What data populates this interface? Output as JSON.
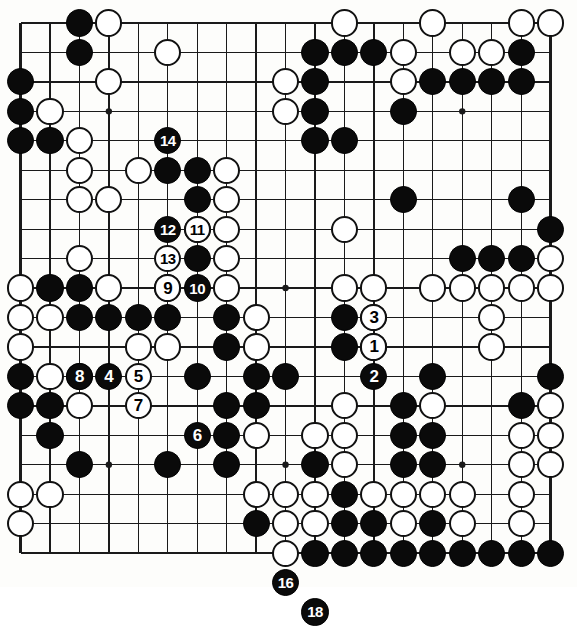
{
  "diagram": {
    "type": "go-board-diagram",
    "board_size": 19,
    "colors": {
      "black_stone": "#0a0a0a",
      "white_stone": "#ffffff",
      "stone_outline": "#111111",
      "grid_line": "#1a1a1a",
      "board_background": "#fdfdfb"
    },
    "geometry": {
      "origin_x": 20.5,
      "origin_y": 23.0,
      "spacing": 29.45,
      "stone_radius": 13.6,
      "border_width": 2.6,
      "line_width": 1.3,
      "star_radius": 3.2
    },
    "star_points": [
      [
        3,
        3
      ],
      [
        9,
        3
      ],
      [
        15,
        3
      ],
      [
        3,
        9
      ],
      [
        9,
        9
      ],
      [
        15,
        9
      ],
      [
        3,
        15
      ],
      [
        9,
        15
      ],
      [
        15,
        15
      ]
    ],
    "stones": [
      {
        "c": 2,
        "r": 0,
        "color": "black"
      },
      {
        "c": 3,
        "r": 0,
        "color": "white"
      },
      {
        "c": 11,
        "r": 0,
        "color": "white"
      },
      {
        "c": 14,
        "r": 0,
        "color": "white"
      },
      {
        "c": 17,
        "r": 0,
        "color": "white"
      },
      {
        "c": 18,
        "r": 0,
        "color": "white"
      },
      {
        "c": 2,
        "r": 1,
        "color": "black"
      },
      {
        "c": 5,
        "r": 1,
        "color": "white"
      },
      {
        "c": 10,
        "r": 1,
        "color": "black"
      },
      {
        "c": 11,
        "r": 1,
        "color": "black"
      },
      {
        "c": 12,
        "r": 1,
        "color": "black"
      },
      {
        "c": 13,
        "r": 1,
        "color": "white"
      },
      {
        "c": 15,
        "r": 1,
        "color": "white"
      },
      {
        "c": 16,
        "r": 1,
        "color": "white"
      },
      {
        "c": 17,
        "r": 1,
        "color": "black"
      },
      {
        "c": 0,
        "r": 2,
        "color": "black"
      },
      {
        "c": 3,
        "r": 2,
        "color": "white"
      },
      {
        "c": 9,
        "r": 2,
        "color": "white"
      },
      {
        "c": 10,
        "r": 2,
        "color": "black"
      },
      {
        "c": 13,
        "r": 2,
        "color": "white"
      },
      {
        "c": 14,
        "r": 2,
        "color": "black"
      },
      {
        "c": 15,
        "r": 2,
        "color": "black"
      },
      {
        "c": 16,
        "r": 2,
        "color": "black"
      },
      {
        "c": 17,
        "r": 2,
        "color": "black"
      },
      {
        "c": 0,
        "r": 3,
        "color": "black"
      },
      {
        "c": 1,
        "r": 3,
        "color": "white"
      },
      {
        "c": 9,
        "r": 3,
        "color": "white"
      },
      {
        "c": 10,
        "r": 3,
        "color": "black"
      },
      {
        "c": 13,
        "r": 3,
        "color": "black"
      },
      {
        "c": 0,
        "r": 4,
        "color": "black"
      },
      {
        "c": 1,
        "r": 4,
        "color": "black"
      },
      {
        "c": 2,
        "r": 4,
        "color": "white"
      },
      {
        "c": 10,
        "r": 4,
        "color": "black"
      },
      {
        "c": 11,
        "r": 4,
        "color": "black"
      },
      {
        "c": 2,
        "r": 5,
        "color": "white"
      },
      {
        "c": 4,
        "r": 5,
        "color": "white"
      },
      {
        "c": 5,
        "r": 5,
        "color": "black"
      },
      {
        "c": 6,
        "r": 5,
        "color": "black"
      },
      {
        "c": 7,
        "r": 5,
        "color": "white"
      },
      {
        "c": 2,
        "r": 6,
        "color": "white"
      },
      {
        "c": 3,
        "r": 6,
        "color": "white"
      },
      {
        "c": 6,
        "r": 6,
        "color": "black"
      },
      {
        "c": 7,
        "r": 6,
        "color": "white"
      },
      {
        "c": 13,
        "r": 6,
        "color": "black"
      },
      {
        "c": 17,
        "r": 6,
        "color": "black"
      },
      {
        "c": 6,
        "r": 7,
        "color": "black"
      },
      {
        "c": 7,
        "r": 7,
        "color": "white"
      },
      {
        "c": 11,
        "r": 7,
        "color": "white"
      },
      {
        "c": 18,
        "r": 7,
        "color": "black"
      },
      {
        "c": 2,
        "r": 8,
        "color": "white"
      },
      {
        "c": 6,
        "r": 8,
        "color": "black"
      },
      {
        "c": 7,
        "r": 8,
        "color": "white"
      },
      {
        "c": 15,
        "r": 8,
        "color": "black"
      },
      {
        "c": 16,
        "r": 8,
        "color": "black"
      },
      {
        "c": 17,
        "r": 8,
        "color": "black"
      },
      {
        "c": 18,
        "r": 8,
        "color": "white"
      },
      {
        "c": 0,
        "r": 9,
        "color": "white"
      },
      {
        "c": 1,
        "r": 9,
        "color": "black"
      },
      {
        "c": 2,
        "r": 9,
        "color": "black"
      },
      {
        "c": 3,
        "r": 9,
        "color": "white"
      },
      {
        "c": 5,
        "r": 9,
        "color": "black"
      },
      {
        "c": 7,
        "r": 9,
        "color": "white"
      },
      {
        "c": 11,
        "r": 9,
        "color": "white"
      },
      {
        "c": 12,
        "r": 9,
        "color": "white"
      },
      {
        "c": 14,
        "r": 9,
        "color": "white"
      },
      {
        "c": 15,
        "r": 9,
        "color": "white"
      },
      {
        "c": 16,
        "r": 9,
        "color": "white"
      },
      {
        "c": 17,
        "r": 9,
        "color": "white"
      },
      {
        "c": 18,
        "r": 9,
        "color": "white"
      },
      {
        "c": 0,
        "r": 10,
        "color": "white"
      },
      {
        "c": 1,
        "r": 10,
        "color": "white"
      },
      {
        "c": 2,
        "r": 10,
        "color": "black"
      },
      {
        "c": 3,
        "r": 10,
        "color": "black"
      },
      {
        "c": 4,
        "r": 10,
        "color": "black"
      },
      {
        "c": 5,
        "r": 10,
        "color": "black"
      },
      {
        "c": 7,
        "r": 10,
        "color": "black"
      },
      {
        "c": 8,
        "r": 10,
        "color": "white"
      },
      {
        "c": 11,
        "r": 10,
        "color": "black"
      },
      {
        "c": 12,
        "r": 10,
        "color": "black"
      },
      {
        "c": 16,
        "r": 10,
        "color": "white"
      },
      {
        "c": 0,
        "r": 11,
        "color": "white"
      },
      {
        "c": 4,
        "r": 11,
        "color": "white"
      },
      {
        "c": 5,
        "r": 11,
        "color": "white"
      },
      {
        "c": 7,
        "r": 11,
        "color": "black"
      },
      {
        "c": 8,
        "r": 11,
        "color": "white"
      },
      {
        "c": 11,
        "r": 11,
        "color": "black"
      },
      {
        "c": 12,
        "r": 11,
        "color": "black"
      },
      {
        "c": 16,
        "r": 11,
        "color": "white"
      },
      {
        "c": 0,
        "r": 12,
        "color": "black"
      },
      {
        "c": 1,
        "r": 12,
        "color": "white"
      },
      {
        "c": 2,
        "r": 12,
        "color": "white"
      },
      {
        "c": 6,
        "r": 12,
        "color": "black"
      },
      {
        "c": 8,
        "r": 12,
        "color": "black"
      },
      {
        "c": 9,
        "r": 12,
        "color": "black"
      },
      {
        "c": 14,
        "r": 12,
        "color": "black"
      },
      {
        "c": 18,
        "r": 12,
        "color": "black"
      },
      {
        "c": 0,
        "r": 13,
        "color": "black"
      },
      {
        "c": 1,
        "r": 13,
        "color": "black"
      },
      {
        "c": 2,
        "r": 13,
        "color": "white"
      },
      {
        "c": 7,
        "r": 13,
        "color": "black"
      },
      {
        "c": 8,
        "r": 13,
        "color": "black"
      },
      {
        "c": 11,
        "r": 13,
        "color": "white"
      },
      {
        "c": 13,
        "r": 13,
        "color": "black"
      },
      {
        "c": 14,
        "r": 13,
        "color": "white"
      },
      {
        "c": 17,
        "r": 13,
        "color": "black"
      },
      {
        "c": 18,
        "r": 13,
        "color": "white"
      },
      {
        "c": 1,
        "r": 14,
        "color": "black"
      },
      {
        "c": 7,
        "r": 14,
        "color": "black"
      },
      {
        "c": 8,
        "r": 14,
        "color": "white"
      },
      {
        "c": 10,
        "r": 14,
        "color": "white"
      },
      {
        "c": 11,
        "r": 14,
        "color": "white"
      },
      {
        "c": 13,
        "r": 14,
        "color": "black"
      },
      {
        "c": 14,
        "r": 14,
        "color": "black"
      },
      {
        "c": 17,
        "r": 14,
        "color": "white"
      },
      {
        "c": 18,
        "r": 14,
        "color": "white"
      },
      {
        "c": 2,
        "r": 15,
        "color": "black"
      },
      {
        "c": 5,
        "r": 15,
        "color": "black"
      },
      {
        "c": 7,
        "r": 15,
        "color": "black"
      },
      {
        "c": 10,
        "r": 15,
        "color": "black"
      },
      {
        "c": 11,
        "r": 15,
        "color": "white"
      },
      {
        "c": 13,
        "r": 15,
        "color": "black"
      },
      {
        "c": 14,
        "r": 15,
        "color": "black"
      },
      {
        "c": 17,
        "r": 15,
        "color": "white"
      },
      {
        "c": 18,
        "r": 15,
        "color": "white"
      },
      {
        "c": 0,
        "r": 16,
        "color": "white"
      },
      {
        "c": 1,
        "r": 16,
        "color": "white"
      },
      {
        "c": 8,
        "r": 16,
        "color": "white"
      },
      {
        "c": 9,
        "r": 16,
        "color": "white"
      },
      {
        "c": 10,
        "r": 16,
        "color": "white"
      },
      {
        "c": 11,
        "r": 16,
        "color": "black"
      },
      {
        "c": 12,
        "r": 16,
        "color": "white"
      },
      {
        "c": 13,
        "r": 16,
        "color": "white"
      },
      {
        "c": 14,
        "r": 16,
        "color": "white"
      },
      {
        "c": 15,
        "r": 16,
        "color": "white"
      },
      {
        "c": 17,
        "r": 16,
        "color": "white"
      },
      {
        "c": 0,
        "r": 17,
        "color": "white"
      },
      {
        "c": 8,
        "r": 17,
        "color": "black"
      },
      {
        "c": 9,
        "r": 17,
        "color": "white"
      },
      {
        "c": 10,
        "r": 17,
        "color": "white"
      },
      {
        "c": 11,
        "r": 17,
        "color": "black"
      },
      {
        "c": 12,
        "r": 17,
        "color": "black"
      },
      {
        "c": 13,
        "r": 17,
        "color": "white"
      },
      {
        "c": 14,
        "r": 17,
        "color": "black"
      },
      {
        "c": 15,
        "r": 17,
        "color": "white"
      },
      {
        "c": 17,
        "r": 17,
        "color": "white"
      },
      {
        "c": 9,
        "r": 18,
        "color": "white"
      },
      {
        "c": 10,
        "r": 18,
        "color": "black"
      },
      {
        "c": 11,
        "r": 18,
        "color": "black"
      },
      {
        "c": 12,
        "r": 18,
        "color": "black"
      },
      {
        "c": 13,
        "r": 18,
        "color": "black"
      },
      {
        "c": 14,
        "r": 18,
        "color": "black"
      },
      {
        "c": 15,
        "r": 18,
        "color": "black"
      },
      {
        "c": 16,
        "r": 18,
        "color": "black"
      },
      {
        "c": 17,
        "r": 18,
        "color": "black"
      },
      {
        "c": 18,
        "r": 18,
        "color": "black"
      }
    ],
    "moves": [
      {
        "n": "1",
        "c": 12,
        "r": 11,
        "color": "white"
      },
      {
        "n": "2",
        "c": 12,
        "r": 12,
        "color": "black"
      },
      {
        "n": "3",
        "c": 12,
        "r": 10,
        "color": "white"
      },
      {
        "n": "4",
        "c": 3,
        "r": 12,
        "color": "black"
      },
      {
        "n": "5",
        "c": 4,
        "r": 12,
        "color": "white"
      },
      {
        "n": "6",
        "c": 6,
        "r": 14,
        "color": "black"
      },
      {
        "n": "7",
        "c": 4,
        "r": 13,
        "color": "white"
      },
      {
        "n": "8",
        "c": 2,
        "r": 12,
        "color": "black"
      },
      {
        "n": "9",
        "c": 5,
        "r": 9,
        "color": "white"
      },
      {
        "n": "10",
        "c": 6,
        "r": 9,
        "color": "black"
      },
      {
        "n": "11",
        "c": 6,
        "r": 7,
        "color": "white"
      },
      {
        "n": "12",
        "c": 5,
        "r": 7,
        "color": "black"
      },
      {
        "n": "13",
        "c": 5,
        "r": 8,
        "color": "white"
      },
      {
        "n": "14",
        "c": 5,
        "r": 4,
        "color": "black"
      },
      {
        "n": "16",
        "c": 9,
        "r": 19,
        "color": "black"
      },
      {
        "n": "18",
        "c": 10,
        "r": 20,
        "color": "black"
      }
    ]
  }
}
